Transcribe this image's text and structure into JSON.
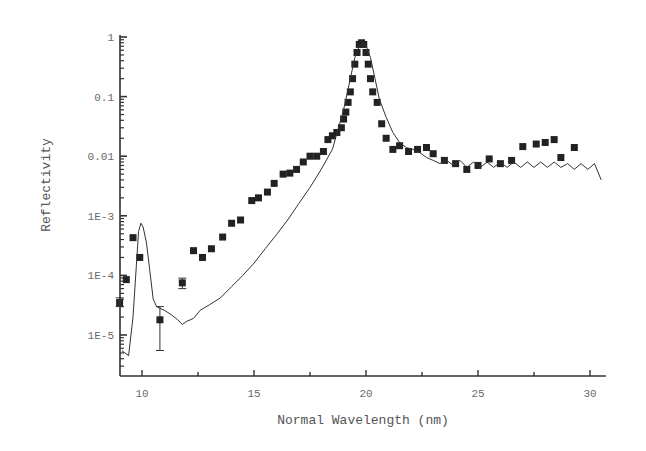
{
  "chart_data": {
    "type": "scatter",
    "title": "",
    "xlabel": "Normal Wavelength (nm)",
    "ylabel": "Reflectivity",
    "xlim": [
      9.0,
      30.7
    ],
    "ylim": [
      2.5e-06,
      1.2
    ],
    "yscale": "log",
    "grid": false,
    "legend": null,
    "xticks": [
      10,
      15,
      20,
      25,
      30
    ],
    "xtick_labels": [
      "10",
      "15",
      "20",
      "25",
      "30"
    ],
    "yticks": [
      1e-05,
      0.0001,
      0.001,
      0.01,
      0.1,
      1
    ],
    "ytick_labels": [
      "1E-5",
      "1E-4",
      "1E-3",
      "0.01",
      "0.1",
      "1"
    ],
    "series": [
      {
        "name": "measured",
        "style": "square-markers",
        "color": "#222222",
        "x": [
          9.0,
          9.3,
          9.6,
          9.9,
          10.8,
          11.8,
          12.3,
          12.7,
          13.1,
          13.6,
          14.0,
          14.4,
          14.9,
          15.2,
          15.6,
          15.9,
          16.3,
          16.6,
          16.9,
          17.2,
          17.5,
          17.8,
          18.1,
          18.3,
          18.5,
          18.7,
          18.9,
          19.0,
          19.1,
          19.2,
          19.3,
          19.4,
          19.5,
          19.6,
          19.7,
          19.8,
          19.9,
          20.0,
          20.1,
          20.2,
          20.3,
          20.5,
          20.7,
          20.9,
          21.2,
          21.5,
          21.9,
          22.3,
          22.7,
          23.0,
          23.5,
          24.0,
          24.5,
          25.0,
          25.5,
          26.0,
          26.5,
          27.0,
          27.6,
          28.0,
          28.4,
          28.7,
          29.3
        ],
        "y": [
          3.5e-05,
          8.5e-05,
          0.00043,
          0.0002,
          1.8e-05,
          7.5e-05,
          0.00026,
          0.0002,
          0.00028,
          0.00044,
          0.00075,
          0.00085,
          0.0018,
          0.002,
          0.0025,
          0.0035,
          0.005,
          0.0052,
          0.006,
          0.008,
          0.01,
          0.01,
          0.012,
          0.019,
          0.022,
          0.025,
          0.03,
          0.042,
          0.055,
          0.08,
          0.12,
          0.2,
          0.35,
          0.55,
          0.75,
          0.8,
          0.75,
          0.55,
          0.35,
          0.2,
          0.12,
          0.08,
          0.035,
          0.02,
          0.013,
          0.015,
          0.012,
          0.013,
          0.014,
          0.011,
          0.0085,
          0.0075,
          0.006,
          0.007,
          0.009,
          0.0075,
          0.0085,
          0.0145,
          0.016,
          0.017,
          0.019,
          0.0095,
          0.014
        ],
        "error_bars": [
          {
            "x": 10.8,
            "y": 1.8e-05,
            "low": 5.5e-06,
            "high": 3e-05
          },
          {
            "x": 11.8,
            "y": 7.5e-05,
            "low": 6e-05,
            "high": 9e-05
          },
          {
            "x": 9.0,
            "y": 3.5e-05,
            "low": 3e-05,
            "high": 4.2e-05
          }
        ]
      },
      {
        "name": "calculated",
        "style": "line",
        "color": "#333333",
        "x": [
          9.1,
          9.4,
          9.6,
          9.75,
          9.85,
          9.95,
          10.05,
          10.2,
          10.35,
          10.5,
          10.65,
          10.8,
          11.0,
          11.3,
          11.6,
          11.8,
          12.0,
          12.3,
          12.6,
          13.0,
          13.5,
          14.0,
          14.5,
          15.0,
          15.5,
          16.0,
          16.5,
          17.0,
          17.5,
          18.0,
          18.5,
          19.0,
          19.3,
          19.5,
          19.7,
          19.85,
          20.0,
          20.2,
          20.4,
          20.6,
          20.9,
          21.2,
          21.5,
          21.8,
          22.1,
          22.4,
          22.7,
          23.0,
          23.3,
          23.6,
          23.9,
          24.2,
          24.5,
          24.8,
          25.1,
          25.4,
          25.7,
          26.0,
          26.3,
          26.6,
          26.9,
          27.2,
          27.5,
          27.8,
          28.1,
          28.4,
          28.7,
          29.0,
          29.3,
          29.6,
          29.9,
          30.2,
          30.5
        ],
        "y": [
          5.5e-06,
          4.5e-06,
          2e-05,
          0.00015,
          0.00055,
          0.00075,
          0.00065,
          0.00035,
          0.00012,
          4e-05,
          3e-05,
          2.8e-05,
          2.6e-05,
          2.2e-05,
          1.8e-05,
          1.5e-05,
          1.7e-05,
          1.9e-05,
          2.6e-05,
          3.2e-05,
          4.2e-05,
          6.5e-05,
          0.0001,
          0.00016,
          0.00028,
          0.00048,
          0.00085,
          0.0016,
          0.003,
          0.006,
          0.013,
          0.06,
          0.2,
          0.45,
          0.7,
          0.78,
          0.72,
          0.45,
          0.2,
          0.09,
          0.045,
          0.025,
          0.017,
          0.014,
          0.013,
          0.0115,
          0.0095,
          0.0085,
          0.0075,
          0.0085,
          0.007,
          0.0085,
          0.0065,
          0.008,
          0.0065,
          0.008,
          0.0065,
          0.008,
          0.0065,
          0.008,
          0.0065,
          0.008,
          0.0065,
          0.008,
          0.0065,
          0.008,
          0.0065,
          0.0075,
          0.006,
          0.0075,
          0.006,
          0.0075,
          0.004
        ]
      }
    ]
  },
  "axes": {
    "x_title": "Normal Wavelength (nm)",
    "y_title": "Reflectivity"
  }
}
